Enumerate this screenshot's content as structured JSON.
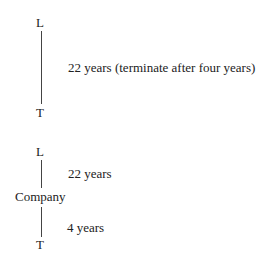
{
  "diagram1": {
    "top_node": "L",
    "bottom_node": "T",
    "edge_label": "22 years (terminate after four years)"
  },
  "diagram2": {
    "top_node": "L",
    "middle_node": "Company",
    "bottom_node": "T",
    "upper_edge_label": "22 years",
    "lower_edge_label": "4 years"
  }
}
